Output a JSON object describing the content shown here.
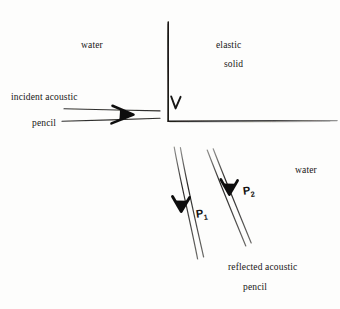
{
  "figure": {
    "kind": "hand-drawn-physics-diagram",
    "ink_color": "#1a1918",
    "paper_color": "#fdfdfc"
  },
  "labels": {
    "water_top": "water",
    "elastic": "elastic",
    "solid": "solid",
    "incident_acoustic": "incident acoustic",
    "incident_pencil": "pencil",
    "water_bottom": "water",
    "reflected_acoustic": "reflected acoustic",
    "reflected_pencil": "pencil"
  },
  "ray_labels": {
    "p1_base": "P",
    "p1_sub": "1",
    "p2_base": "P",
    "p2_sub": "2"
  },
  "geometry": {
    "interface_vertical": {
      "x": 168,
      "y_top": 22,
      "y_bottom": 121
    },
    "interface_horizontal": {
      "y": 121,
      "x_left": 168,
      "x_right": 337
    },
    "corner_arrowhead": {
      "x": 175,
      "y": 103,
      "glyph": "V"
    },
    "incident_beam": {
      "upper_line": {
        "x1": 64,
        "y1": 109,
        "x2": 160,
        "y2": 111
      },
      "lower_line": {
        "x1": 62,
        "y1": 121,
        "x2": 160,
        "y2": 118
      },
      "arrowhead": {
        "x": 125,
        "y": 114
      }
    },
    "reflected_beam_1": {
      "upper_line": {
        "x1": 174,
        "y1": 147,
        "x2": 198,
        "y2": 259
      },
      "lower_line": {
        "x1": 180,
        "y1": 147,
        "x2": 204,
        "y2": 257
      },
      "arrowhead": {
        "x": 181,
        "y": 206
      }
    },
    "reflected_beam_2": {
      "upper_line": {
        "x1": 207,
        "y1": 150,
        "x2": 246,
        "y2": 246
      },
      "lower_line": {
        "x1": 213,
        "y1": 149,
        "x2": 251,
        "y2": 243
      },
      "arrowhead": {
        "x": 229,
        "y": 189
      }
    }
  }
}
